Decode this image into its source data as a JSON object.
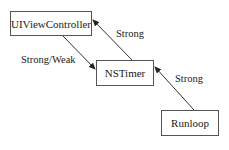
{
  "diagram": {
    "nodes": [
      {
        "id": "uivc",
        "label": "UIViewController"
      },
      {
        "id": "timer",
        "label": "NSTimer"
      },
      {
        "id": "runloop",
        "label": "Runloop"
      }
    ],
    "edges": [
      {
        "from": "NSTimer",
        "to": "UIViewController",
        "label": "Strong"
      },
      {
        "from": "UIViewController",
        "to": "NSTimer",
        "label": "Strong/Weak"
      },
      {
        "from": "Runloop",
        "to": "NSTimer",
        "label": "Strong"
      }
    ]
  }
}
